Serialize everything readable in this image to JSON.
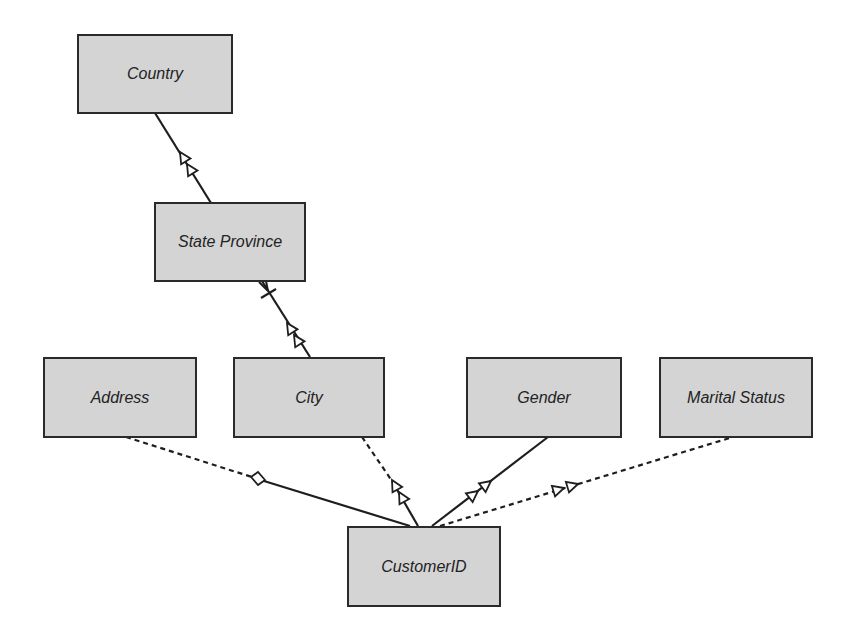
{
  "diagram": {
    "type": "dimension-hierarchy",
    "colors": {
      "node_fill": "#d4d4d4",
      "node_border": "#2a2a2a",
      "line": "#1e1e1e",
      "background": "#ffffff"
    },
    "nodes": [
      {
        "id": "country",
        "label": "Country",
        "x": 77,
        "y": 34,
        "w": 156,
        "h": 80
      },
      {
        "id": "state_province",
        "label": "State Province",
        "x": 154,
        "y": 202,
        "w": 152,
        "h": 80
      },
      {
        "id": "address",
        "label": "Address",
        "x": 43,
        "y": 357,
        "w": 154,
        "h": 81
      },
      {
        "id": "city",
        "label": "City",
        "x": 233,
        "y": 357,
        "w": 152,
        "h": 81
      },
      {
        "id": "gender",
        "label": "Gender",
        "x": 466,
        "y": 357,
        "w": 156,
        "h": 81
      },
      {
        "id": "marital_status",
        "label": "Marital Status",
        "x": 659,
        "y": 357,
        "w": 154,
        "h": 81
      },
      {
        "id": "customer_id",
        "label": "CustomerID",
        "x": 347,
        "y": 526,
        "w": 154,
        "h": 81
      }
    ],
    "edges": [
      {
        "from": "state_province",
        "to": "country",
        "style": "solid",
        "end": "double-arrow"
      },
      {
        "from": "city",
        "to": "state_province",
        "style": "solid",
        "end": "double-arrow",
        "start": "crows-foot-bar"
      },
      {
        "from": "customer_id",
        "to": "address",
        "style": "solid-then-dashed",
        "marker": "diamond"
      },
      {
        "from": "customer_id",
        "to": "city",
        "style": "solid-then-dashed",
        "end": "double-arrow"
      },
      {
        "from": "customer_id",
        "to": "gender",
        "style": "solid",
        "end": "double-arrow"
      },
      {
        "from": "customer_id",
        "to": "marital_status",
        "style": "dashed",
        "end": "double-arrow"
      }
    ]
  }
}
